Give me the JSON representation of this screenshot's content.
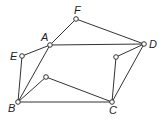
{
  "diagram": {
    "type": "graph",
    "stroke_color": "#333333",
    "node_fill": "#ffffff",
    "nodes": [
      {
        "id": "F",
        "label": "F",
        "x": 76,
        "y": 19,
        "lx": 74,
        "ly": 14
      },
      {
        "id": "A",
        "label": "A",
        "x": 50,
        "y": 45,
        "lx": 41,
        "ly": 41
      },
      {
        "id": "E",
        "label": "E",
        "x": 22,
        "y": 56,
        "lx": 10,
        "ly": 60
      },
      {
        "id": "D",
        "label": "D",
        "x": 144,
        "y": 44,
        "lx": 149,
        "ly": 48
      },
      {
        "id": "P1",
        "label": "",
        "x": 116,
        "y": 57
      },
      {
        "id": "P2",
        "label": "",
        "x": 46,
        "y": 77
      },
      {
        "id": "B",
        "label": "B",
        "x": 18,
        "y": 102,
        "lx": 8,
        "ly": 112
      },
      {
        "id": "C",
        "label": "C",
        "x": 112,
        "y": 102,
        "lx": 109,
        "ly": 114
      }
    ],
    "edges": [
      {
        "from": "A",
        "to": "F"
      },
      {
        "from": "F",
        "to": "D"
      },
      {
        "from": "A",
        "to": "D"
      },
      {
        "from": "A",
        "to": "E"
      },
      {
        "from": "E",
        "to": "B"
      },
      {
        "from": "A",
        "to": "B"
      },
      {
        "from": "B",
        "to": "P2"
      },
      {
        "from": "P2",
        "to": "C"
      },
      {
        "from": "B",
        "to": "C"
      },
      {
        "from": "C",
        "to": "P1"
      },
      {
        "from": "P1",
        "to": "D"
      },
      {
        "from": "C",
        "to": "D"
      }
    ]
  }
}
